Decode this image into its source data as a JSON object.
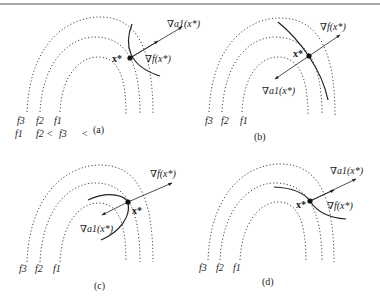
{
  "figure": {
    "border_color": "#8a8a8a",
    "line_color": "#222222",
    "panels": [
      {
        "id": "a",
        "caption": "(a)",
        "contour_labels": [
          "f3",
          "f2",
          "f1"
        ],
        "ordering_text": {
          "parts": [
            "f1",
            "f2 <",
            "f3",
            "<"
          ]
        },
        "point_label": "x*",
        "vectors": [
          {
            "name": "grad-a1",
            "label": "∇a1(x*)"
          },
          {
            "name": "grad-f",
            "label": "∇f(x*)"
          }
        ]
      },
      {
        "id": "b",
        "caption": "(b)",
        "contour_labels": [
          "f3",
          "f2",
          "f1"
        ],
        "point_label": "x*",
        "vectors": [
          {
            "name": "grad-f",
            "label": "∇f(x*)"
          },
          {
            "name": "grad-a1",
            "label": "∇a1(x*)"
          }
        ]
      },
      {
        "id": "c",
        "caption": "(c)",
        "contour_labels": [
          "f3",
          "f2",
          "f1"
        ],
        "point_label": "x*",
        "vectors": [
          {
            "name": "grad-f",
            "label": "∇f(x*)"
          },
          {
            "name": "grad-a1",
            "label": "∇a1(x*)"
          }
        ]
      },
      {
        "id": "d",
        "caption": "(d)",
        "contour_labels": [
          "f3",
          "f2",
          "f1"
        ],
        "point_label": "x*",
        "vectors": [
          {
            "name": "grad-a1",
            "label": "∇a1(x*)"
          },
          {
            "name": "grad-f",
            "label": "∇f(x*)"
          }
        ]
      }
    ]
  }
}
